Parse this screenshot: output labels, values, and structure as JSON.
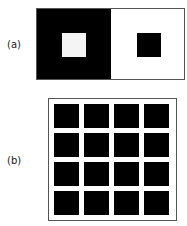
{
  "figure_a": {
    "label": "(a)",
    "left_panel": {
      "background": "#000000",
      "inner_square": "#f4f4f4"
    },
    "right_panel": {
      "background": "#ffffff",
      "inner_square": "#000000"
    }
  },
  "figure_b": {
    "label": "(b)",
    "grid": {
      "rows": 4,
      "columns": 4,
      "cell_color": "#000000",
      "line_color": "#ffffff"
    }
  }
}
